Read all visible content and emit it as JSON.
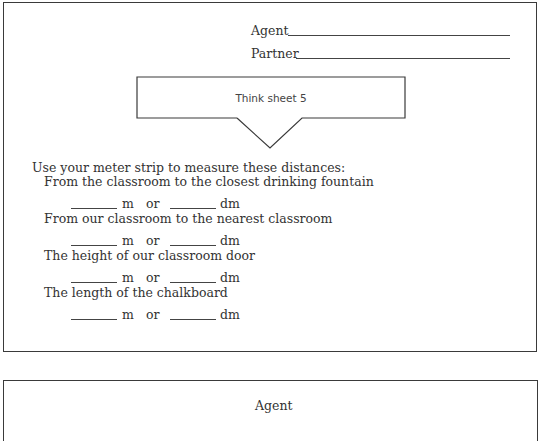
{
  "sheet": {
    "signature": {
      "agent_label": "Agent",
      "partner_label": "Partner"
    },
    "bubble": {
      "title": "Think sheet 5"
    },
    "instruction": "Use your meter strip to measure these distances:",
    "items": [
      {
        "label": "From the classroom to the closest drinking fountain",
        "unit1": "m",
        "or": "or",
        "unit2": "dm"
      },
      {
        "label": "From our classroom to the nearest classroom",
        "unit1": "m",
        "or": "or",
        "unit2": "dm"
      },
      {
        "label": "The height of our classroom door",
        "unit1": "m",
        "or": "or",
        "unit2": "dm"
      },
      {
        "label": "The length of the chalkboard",
        "unit1": "m",
        "or": "or",
        "unit2": "dm"
      }
    ]
  },
  "sheet2": {
    "agent_label": "Agent"
  }
}
